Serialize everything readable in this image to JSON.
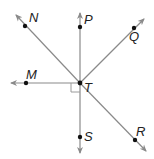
{
  "diagram": {
    "center": {
      "label": "T",
      "x": 80,
      "y": 83
    },
    "line_color": "#8a8a8a",
    "point_color": "#111111",
    "points": [
      {
        "label": "N",
        "x": 25,
        "y": 26
      },
      {
        "label": "P",
        "x": 80,
        "y": 27
      },
      {
        "label": "Q",
        "x": 134,
        "y": 28
      },
      {
        "label": "M",
        "x": 26,
        "y": 83
      },
      {
        "label": "S",
        "x": 80,
        "y": 137
      },
      {
        "label": "R",
        "x": 135,
        "y": 140
      }
    ],
    "rays": [
      {
        "from": "T",
        "through": "N"
      },
      {
        "from": "T",
        "through": "P"
      },
      {
        "from": "T",
        "through": "Q"
      },
      {
        "from": "T",
        "through": "M"
      },
      {
        "from": "T",
        "through": "S"
      },
      {
        "from": "T",
        "through": "R"
      }
    ],
    "right_angle": {
      "between": [
        "M",
        "S"
      ],
      "at": "T"
    }
  }
}
